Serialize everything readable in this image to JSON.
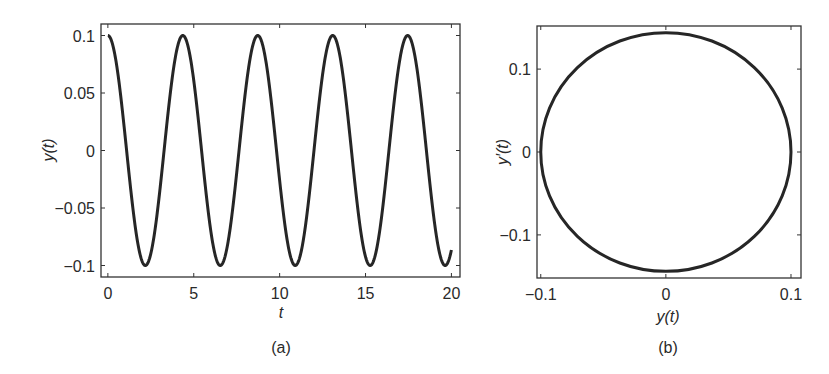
{
  "chart_data": [
    {
      "panel": "(a)",
      "type": "line",
      "title": "",
      "caption": "(a)",
      "xlabel": "t",
      "ylabel": "y(t)",
      "xlim": [
        -0.4,
        20.5
      ],
      "ylim": [
        -0.11,
        0.11
      ],
      "xticks": [
        0,
        5,
        10,
        15,
        20
      ],
      "xtick_labels": [
        "0",
        "5",
        "10",
        "15",
        "20"
      ],
      "yticks": [
        0.1,
        0.05,
        0,
        -0.05,
        -0.1
      ],
      "ytick_labels": [
        "0.1",
        "0.05",
        "0",
        "−0.05",
        "−0.1"
      ],
      "grid": false,
      "legend": null,
      "series": [
        {
          "name": "y(t)",
          "description": "y(t) = 0.1 cos(1.44 t), t from 0 to 20",
          "amplitude": 0.1,
          "omega": 1.44,
          "t_start": 0,
          "t_end": 20,
          "peaks_t": [
            0,
            4.37,
            8.73,
            13.1,
            17.46
          ],
          "troughs_t": [
            2.18,
            6.55,
            10.91,
            15.28,
            19.64
          ],
          "end_value": -0.077
        }
      ]
    },
    {
      "panel": "(b)",
      "type": "line",
      "title": "",
      "caption": "(b)",
      "xlabel": "y(t)",
      "ylabel": "y′(t)",
      "xlim": [
        -0.103,
        0.108
      ],
      "ylim": [
        -0.152,
        0.152
      ],
      "xticks": [
        -0.1,
        0,
        0.1
      ],
      "xtick_labels": [
        "−0.1",
        "0",
        "0.1"
      ],
      "yticks": [
        0.1,
        0,
        -0.1
      ],
      "ytick_labels": [
        "0.1",
        "0",
        "−0.1"
      ],
      "grid": false,
      "legend": null,
      "series": [
        {
          "name": "phase portrait",
          "description": "Closed ellipse: y from -0.1 to 0.1, y' from -0.144 to 0.144",
          "x_semi_axis": 0.1,
          "y_semi_axis": 0.144,
          "center": [
            0,
            0
          ]
        }
      ]
    }
  ]
}
